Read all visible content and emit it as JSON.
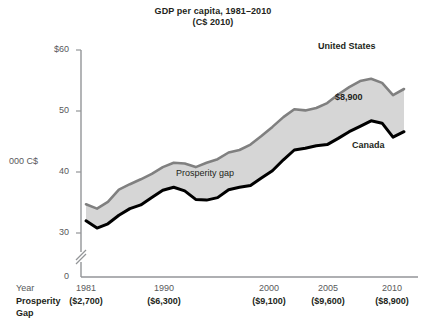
{
  "chart_data": {
    "type": "area",
    "title": "GDP per capita, 1981–2010",
    "subtitle": "(C$ 2010)",
    "ylabel": "000 C$",
    "xlabel": "Year",
    "ylim": [
      30,
      60
    ],
    "axis_break": true,
    "zero_tick": "0",
    "ytick_labels": [
      "$60",
      "50",
      "40",
      "30"
    ],
    "ytick_values": [
      60,
      50,
      40,
      30
    ],
    "xtick_labels": [
      "1981",
      "1990",
      "2000",
      "2005",
      "2010"
    ],
    "xtick_values": [
      1981,
      1990,
      2000,
      2005,
      2010
    ],
    "grid": false,
    "legend_position": "inline-annotations",
    "annotations": {
      "band_label": "Prosperity gap",
      "endpoint_value": "$8,900",
      "upper_series_label": "United States",
      "lower_series_label": "Canada"
    },
    "x": [
      1981,
      1982,
      1983,
      1984,
      1985,
      1986,
      1987,
      1988,
      1989,
      1990,
      1991,
      1992,
      1993,
      1994,
      1995,
      1996,
      1997,
      1998,
      1999,
      2000,
      2001,
      2002,
      2003,
      2004,
      2005,
      2006,
      2007,
      2008,
      2009,
      2010
    ],
    "series": [
      {
        "name": "United States",
        "color": "#808080",
        "values": [
          34.7,
          34.0,
          35.1,
          37.1,
          38.0,
          38.8,
          39.7,
          40.8,
          41.5,
          41.4,
          40.8,
          41.5,
          42.1,
          43.2,
          43.6,
          44.5,
          45.9,
          47.4,
          49.0,
          50.3,
          50.1,
          50.5,
          51.3,
          52.7,
          53.9,
          54.9,
          55.3,
          54.6,
          52.6,
          53.6
        ],
        "label_at": {
          "year": 2007,
          "text": "United States"
        }
      },
      {
        "name": "Canada",
        "color": "#000000",
        "values": [
          32.0,
          30.8,
          31.5,
          32.9,
          34.0,
          34.6,
          35.8,
          37.0,
          37.5,
          36.9,
          35.5,
          35.4,
          35.8,
          37.1,
          37.5,
          37.8,
          39.0,
          40.2,
          42.0,
          43.6,
          43.9,
          44.3,
          44.5,
          45.5,
          46.6,
          47.5,
          48.4,
          48.0,
          45.7,
          46.6
        ]
      }
    ],
    "gap_series": {
      "name": "Prosperity gap",
      "fill_color": "#d6d6d6",
      "values_by_year": {
        "1981": "($2,700)",
        "1990": "($6,300)",
        "2000": "($9,100)",
        "2005": "($9,600)",
        "2010": "($8,900)"
      }
    },
    "gap_row_label_line1": "Prosperity",
    "gap_row_label_line2": "Gap",
    "gap_row_values": [
      "($2,700)",
      "($6,300)",
      "($9,100)",
      "($9,600)",
      "($8,900)"
    ]
  }
}
